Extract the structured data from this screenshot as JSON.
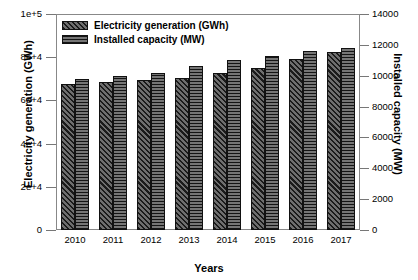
{
  "chart_data": {
    "type": "bar",
    "title": "",
    "xlabel": "Years",
    "ylabel": "Electricity generation (GWh)",
    "y2label": "Installed capacity (MW)",
    "categories": [
      "2010",
      "2011",
      "2012",
      "2013",
      "2014",
      "2015",
      "2016",
      "2017"
    ],
    "series": [
      {
        "name": "Electricity generation (GWh)",
        "axis": "left",
        "pattern": "diagonal-hatch",
        "values": [
          67600,
          68500,
          69400,
          70400,
          72800,
          75000,
          79000,
          82400
        ]
      },
      {
        "name": "Installed capacity (MW)",
        "axis": "right",
        "pattern": "horizontal-hatch",
        "values": [
          9800,
          10000,
          10200,
          10600,
          11000,
          11300,
          11600,
          11800
        ]
      }
    ],
    "ylim": [
      0,
      100000
    ],
    "y2lim": [
      0,
      14000
    ],
    "yticks": [
      0,
      20000,
      40000,
      60000,
      80000,
      100000
    ],
    "ytick_labels": [
      "0",
      "2e+4",
      "4e+4",
      "6e+4",
      "8e+4",
      "1e+5"
    ],
    "y2ticks": [
      0,
      2000,
      4000,
      6000,
      8000,
      10000,
      12000,
      14000
    ],
    "y2tick_labels": [
      "0",
      "2000",
      "4000",
      "6000",
      "8000",
      "10000",
      "12000",
      "14000"
    ],
    "grid": false,
    "legend_position": "top-left",
    "legend": [
      "Electricity generation (GWh)",
      "Installed capacity (MW)"
    ]
  }
}
